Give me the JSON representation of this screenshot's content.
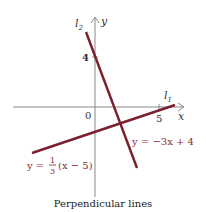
{
  "figure": {
    "caption": "Perpendicular lines",
    "axis_labels": {
      "x": "x",
      "y": "y"
    },
    "origin_label": "0",
    "tick_labels": {
      "x": "5",
      "y": "4"
    },
    "line_labels": {
      "l1": "l",
      "l1_sub": "1",
      "l2": "l",
      "l2_sub": "2"
    },
    "equations": {
      "l2": "y = −3x + 4",
      "l1_prefix": "y =",
      "l1_num": "1",
      "l1_den": "3",
      "l1_suffix": "(x − 5)"
    },
    "colors": {
      "line": "#7a1f2e",
      "axis": "#888888"
    }
  }
}
